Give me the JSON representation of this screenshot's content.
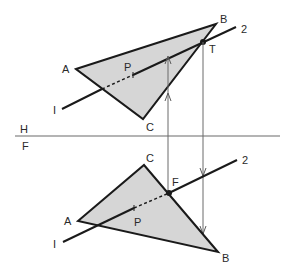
{
  "diagram": {
    "colors": {
      "line": "#1a1a1a",
      "fill": "#d6d6d6",
      "projection": "#6a6a6a",
      "background": "#ffffff"
    },
    "fold_line": {
      "top_label": "H",
      "bottom_label": "F"
    },
    "top_view": {
      "vertices": {
        "A": "A",
        "B": "B",
        "C": "C"
      },
      "line_end_1": "I",
      "line_end_2": "2",
      "point_P": "P",
      "piercing_point": "T"
    },
    "front_view": {
      "vertices": {
        "A": "A",
        "B": "B",
        "C": "C"
      },
      "line_end_1": "I",
      "line_end_2": "2",
      "point_P": "P",
      "piercing_point": "F"
    }
  }
}
